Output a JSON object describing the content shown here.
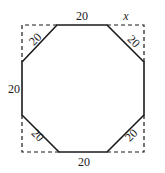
{
  "diagram": {
    "labels": {
      "top": "20",
      "bottom": "20",
      "left": "20",
      "top_left_diag": "20",
      "top_right_diag": "20",
      "bottom_left_diag": "20",
      "bottom_right_diag": "20",
      "corner_x": "x"
    },
    "colors": {
      "stroke": "#1a1a1a",
      "background": "#ffffff"
    }
  }
}
